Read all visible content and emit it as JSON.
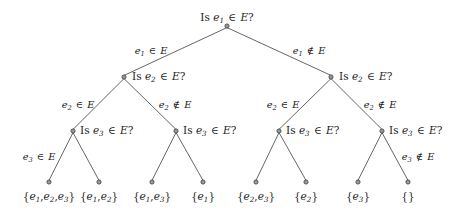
{
  "diagram": {
    "type": "binary-decision-tree",
    "width": 460,
    "height": 215,
    "background_color": "#ffffff",
    "edge_color": "#555555",
    "node_fill_color": "#9a9a9a",
    "node_stroke_color": "#3a3a3a",
    "text_color": "#1a1a1a"
  },
  "nodes": [
    {
      "id": "n0",
      "level": 0,
      "x": 227,
      "y": 26,
      "kind": "question",
      "text": "Is e1 ∈ E?",
      "label_parts": {
        "prefix": "Is ",
        "var": "e",
        "sub": "1",
        "op": " ∈ ",
        "set": "E",
        "suffix": "?"
      },
      "label_x": 227,
      "label_y": 12,
      "label_align": "center"
    },
    {
      "id": "n1",
      "level": 1,
      "x": 124,
      "y": 77,
      "kind": "question",
      "text": "Is e2 ∈ E?",
      "label_parts": {
        "prefix": "Is ",
        "var": "e",
        "sub": "2",
        "op": " ∈ ",
        "set": "E",
        "suffix": "?"
      },
      "label_x": 132,
      "label_y": 71,
      "label_align": "left"
    },
    {
      "id": "n2",
      "level": 1,
      "x": 331,
      "y": 77,
      "kind": "question",
      "text": "Is e2 ∈ E?",
      "label_parts": {
        "prefix": "Is ",
        "var": "e",
        "sub": "2",
        "op": " ∈ ",
        "set": "E",
        "suffix": "?"
      },
      "label_x": 339,
      "label_y": 71,
      "label_align": "left"
    },
    {
      "id": "n3",
      "level": 2,
      "x": 73,
      "y": 131,
      "kind": "question",
      "text": "Is e3 ∈ E?",
      "label_parts": {
        "prefix": "Is ",
        "var": "e",
        "sub": "3",
        "op": " ∈ ",
        "set": "E",
        "suffix": "?"
      },
      "label_x": 80,
      "label_y": 125,
      "label_align": "left"
    },
    {
      "id": "n4",
      "level": 2,
      "x": 176,
      "y": 131,
      "kind": "question",
      "text": "Is e3 ∈ E?",
      "label_parts": {
        "prefix": "Is ",
        "var": "e",
        "sub": "3",
        "op": " ∈ ",
        "set": "E",
        "suffix": "?"
      },
      "label_x": 183,
      "label_y": 125,
      "label_align": "left"
    },
    {
      "id": "n5",
      "level": 2,
      "x": 279,
      "y": 131,
      "kind": "question",
      "text": "Is e3 ∈ E?",
      "label_parts": {
        "prefix": "Is ",
        "var": "e",
        "sub": "3",
        "op": " ∈ ",
        "set": "E",
        "suffix": "?"
      },
      "label_x": 286,
      "label_y": 125,
      "label_align": "left"
    },
    {
      "id": "n6",
      "level": 2,
      "x": 382,
      "y": 131,
      "kind": "question",
      "text": "Is e3 ∈ E?",
      "label_parts": {
        "prefix": "Is ",
        "var": "e",
        "sub": "3",
        "op": " ∈ ",
        "set": "E",
        "suffix": "?"
      },
      "label_x": 389,
      "label_y": 125,
      "label_align": "left"
    },
    {
      "id": "l0",
      "level": 3,
      "x": 49,
      "y": 182,
      "kind": "leaf",
      "text": "{e1,e2,e3}",
      "label_x": 49,
      "label_y": 191,
      "label_align": "center"
    },
    {
      "id": "l1",
      "level": 3,
      "x": 99,
      "y": 182,
      "kind": "leaf",
      "text": "{e1,e2}",
      "label_x": 99,
      "label_y": 191,
      "label_align": "center"
    },
    {
      "id": "l2",
      "level": 3,
      "x": 152,
      "y": 182,
      "kind": "leaf",
      "text": "{e1,e3}",
      "label_x": 152,
      "label_y": 191,
      "label_align": "center"
    },
    {
      "id": "l3",
      "level": 3,
      "x": 203,
      "y": 182,
      "kind": "leaf",
      "text": "{e1}",
      "label_x": 203,
      "label_y": 191,
      "label_align": "center"
    },
    {
      "id": "l4",
      "level": 3,
      "x": 256,
      "y": 182,
      "kind": "leaf",
      "text": "{e2,e3}",
      "label_x": 256,
      "label_y": 191,
      "label_align": "center"
    },
    {
      "id": "l5",
      "level": 3,
      "x": 306,
      "y": 182,
      "kind": "leaf",
      "text": "{e2}",
      "label_x": 306,
      "label_y": 191,
      "label_align": "center"
    },
    {
      "id": "l6",
      "level": 3,
      "x": 358,
      "y": 182,
      "kind": "leaf",
      "text": "{e3}",
      "label_x": 358,
      "label_y": 191,
      "label_align": "center"
    },
    {
      "id": "l7",
      "level": 3,
      "x": 408,
      "y": 182,
      "kind": "leaf",
      "text": "{}",
      "label_x": 408,
      "label_y": 191,
      "label_align": "center"
    }
  ],
  "leaf_sets": [
    {
      "id": "l0",
      "parts": [
        "e",
        "1",
        "e",
        "2",
        "e",
        "3"
      ],
      "display": "{e1,e2,e3}",
      "elements": 3
    },
    {
      "id": "l1",
      "parts": [
        "e",
        "1",
        "e",
        "2"
      ],
      "display": "{e1,e2}",
      "elements": 2
    },
    {
      "id": "l2",
      "parts": [
        "e",
        "1",
        "e",
        "3"
      ],
      "display": "{e1,e3}",
      "elements": 2
    },
    {
      "id": "l3",
      "parts": [
        "e",
        "1"
      ],
      "display": "{e1}",
      "elements": 1
    },
    {
      "id": "l4",
      "parts": [
        "e",
        "2",
        "e",
        "3"
      ],
      "display": "{e2,e3}",
      "elements": 2
    },
    {
      "id": "l5",
      "parts": [
        "e",
        "2"
      ],
      "display": "{e2}",
      "elements": 1
    },
    {
      "id": "l6",
      "parts": [
        "e",
        "3"
      ],
      "display": "{e3}",
      "elements": 1
    },
    {
      "id": "l7",
      "parts": [],
      "display": "{}",
      "elements": 0
    }
  ],
  "edges": [
    {
      "from": "n0",
      "to": "n1",
      "branch": "yes"
    },
    {
      "from": "n0",
      "to": "n2",
      "branch": "no"
    },
    {
      "from": "n1",
      "to": "n3",
      "branch": "yes"
    },
    {
      "from": "n1",
      "to": "n4",
      "branch": "no"
    },
    {
      "from": "n2",
      "to": "n5",
      "branch": "yes"
    },
    {
      "from": "n2",
      "to": "n6",
      "branch": "no"
    },
    {
      "from": "n3",
      "to": "l0",
      "branch": "yes"
    },
    {
      "from": "n3",
      "to": "l1",
      "branch": "no"
    },
    {
      "from": "n4",
      "to": "l2",
      "branch": "yes"
    },
    {
      "from": "n4",
      "to": "l3",
      "branch": "no"
    },
    {
      "from": "n5",
      "to": "l4",
      "branch": "yes"
    },
    {
      "from": "n5",
      "to": "l5",
      "branch": "no"
    },
    {
      "from": "n6",
      "to": "l6",
      "branch": "yes"
    },
    {
      "from": "n6",
      "to": "l7",
      "branch": "no"
    }
  ],
  "edge_labels": [
    {
      "id": "el0",
      "text": "e1 ∈ E",
      "var": "e",
      "sub": "1",
      "op": "∈",
      "set": "E",
      "x": 151,
      "y": 46,
      "align": "center",
      "for_edge": "n0-n1"
    },
    {
      "id": "el1",
      "text": "e1 ∉ E",
      "var": "e",
      "sub": "1",
      "op": "∉",
      "set": "E",
      "x": 309,
      "y": 46,
      "align": "center",
      "for_edge": "n0-n2"
    },
    {
      "id": "el2",
      "text": "e2 ∈ E",
      "var": "e",
      "sub": "2",
      "op": "∈",
      "set": "E",
      "x": 78,
      "y": 100,
      "align": "center",
      "for_edge": "n1-n3"
    },
    {
      "id": "el3",
      "text": "e2 ∉ E",
      "var": "e",
      "sub": "2",
      "op": "∉",
      "set": "E",
      "x": 175,
      "y": 100,
      "align": "center",
      "for_edge": "n1-n4"
    },
    {
      "id": "el4",
      "text": "e2 ∈ E",
      "var": "e",
      "sub": "2",
      "op": "∈",
      "set": "E",
      "x": 283,
      "y": 100,
      "align": "center",
      "for_edge": "n2-n5"
    },
    {
      "id": "el5",
      "text": "e2 ∉ E",
      "var": "e",
      "sub": "2",
      "op": "∉",
      "set": "E",
      "x": 380,
      "y": 100,
      "align": "center",
      "for_edge": "n2-n6"
    },
    {
      "id": "el6",
      "text": "e3 ∈ E",
      "var": "e",
      "sub": "3",
      "op": "∈",
      "set": "E",
      "x": 39,
      "y": 152,
      "align": "center",
      "for_edge": "n3-l0"
    },
    {
      "id": "el7",
      "text": "e3 ∉ E",
      "var": "e",
      "sub": "3",
      "op": "∉",
      "set": "E",
      "x": 418,
      "y": 152,
      "align": "center",
      "for_edge": "n6-l7"
    }
  ]
}
